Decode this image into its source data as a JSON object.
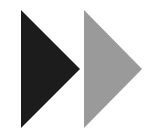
{
  "icon": {
    "name": "fast-forward",
    "shapes": [
      {
        "name": "triangle-dark",
        "color": "#1c1c1c"
      },
      {
        "name": "triangle-light",
        "color": "#9a9a9a"
      }
    ]
  }
}
